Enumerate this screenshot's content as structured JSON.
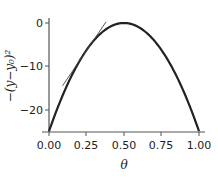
{
  "chart_data": {
    "type": "line",
    "title": "",
    "xlabel": "θ",
    "ylabel": "−(y−y₀)²",
    "xlim": [
      0,
      1
    ],
    "ylim": [
      -25,
      0
    ],
    "x_ticks": [
      "0.00",
      "0.25",
      "0.50",
      "0.75",
      "1.00"
    ],
    "y_ticks": [
      "0",
      "−10",
      "−20"
    ],
    "grid": false,
    "legend": null,
    "series": [
      {
        "name": "curve",
        "style": "thick-dark",
        "x": [
          0.0,
          0.1,
          0.2,
          0.25,
          0.3,
          0.4,
          0.5,
          0.6,
          0.7,
          0.75,
          0.8,
          0.9,
          1.0
        ],
        "values": [
          -25,
          -16,
          -9,
          -6.25,
          -4,
          -1,
          0,
          -1,
          -4,
          -6.25,
          -9,
          -16,
          -25
        ]
      },
      {
        "name": "tangent line",
        "style": "thin-dark",
        "x": [
          0.09,
          0.38
        ],
        "values": [
          -14.5,
          0.25
        ]
      }
    ]
  }
}
